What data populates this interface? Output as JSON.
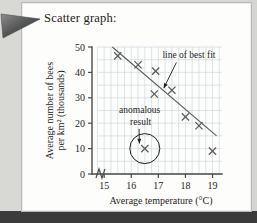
{
  "page": {
    "title": "Scatter graph:",
    "pointer_icon": "triangle-pointer-icon"
  },
  "colors": {
    "grid": "#c3cfd8",
    "axis": "#4a4a4a",
    "marker": "#5b5b5b",
    "fit_line": "#5b5b5b",
    "text": "#1f1f1f",
    "page_background": "#fdfdfb",
    "outer_background": "#d8d9d4",
    "page_edge": "#3a3b3a"
  },
  "chart_data": {
    "type": "scatter",
    "title": "",
    "xlabel": "Average temperature (°C)",
    "ylabel": "Average number of bees per km² (thousands)",
    "xlim": [
      14.55,
      19.35
    ],
    "ylim": [
      0,
      50
    ],
    "xticks": [
      15,
      16,
      17,
      18,
      19
    ],
    "xtick_labels": [
      "15",
      "16",
      "17",
      "18",
      "19"
    ],
    "yticks": [
      0,
      10,
      20,
      30,
      40,
      50
    ],
    "ytick_labels": [
      "0",
      "10",
      "20",
      "30",
      "40",
      "50"
    ],
    "x_minor_step": 0.25,
    "y_minor_step": 5,
    "grid": true,
    "axis_break_on_x": true,
    "legend": null,
    "points": [
      {
        "x": 15.5,
        "y": 46.5
      },
      {
        "x": 16.25,
        "y": 43.0
      },
      {
        "x": 16.9,
        "y": 40.5
      },
      {
        "x": 16.85,
        "y": 31.5
      },
      {
        "x": 17.5,
        "y": 33.0
      },
      {
        "x": 18.0,
        "y": 22.5
      },
      {
        "x": 18.5,
        "y": 19.0
      },
      {
        "x": 19.0,
        "y": 9.0
      },
      {
        "x": 16.5,
        "y": 10.0
      }
    ],
    "fit_line": {
      "label": "line of best fit",
      "x_start": 15.3,
      "y_start": 50.0,
      "x_end": 19.15,
      "y_end": 15.0
    },
    "annotations": [
      {
        "name": "line-of-best-fit",
        "text": "line of best fit",
        "text_x": 17.15,
        "text_y": 45.5,
        "arrow_to_x": 17.2,
        "arrow_to_y": 33.8
      },
      {
        "name": "anomalous-result",
        "text_line1": "anomalous",
        "text_line2": "result",
        "text_x": 15.55,
        "text_y": 24.0,
        "arrow_to_x": 16.3,
        "arrow_to_y": 12.0,
        "circled_point": {
          "x": 16.5,
          "y": 10.0,
          "radius_px": 15
        }
      }
    ]
  }
}
